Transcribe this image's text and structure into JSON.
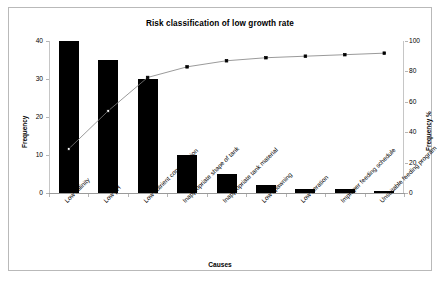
{
  "chart_data": {
    "type": "bar",
    "title": "Risk classification of low growth rate",
    "xlabel": "Causes",
    "ylabel": "Frequency",
    "y2label": "Frequency %",
    "categories": [
      "Low salinity",
      "Low pH",
      "Low nutrient concentration",
      "Inappropriate shape of tank",
      "Inappropriate tank material",
      "Low spawning",
      "Low aeration",
      "Improper feeding schedule",
      "Unsuitable feeding program"
    ],
    "values": [
      40,
      35,
      30,
      10,
      5,
      2,
      1,
      1,
      0.5
    ],
    "cumulative_percent": [
      29,
      54,
      76,
      83,
      87,
      89,
      90,
      91,
      92
    ],
    "ylim": [
      0,
      40
    ],
    "y2lim": [
      0,
      100
    ],
    "yticks": [
      "0",
      "10",
      "20",
      "30",
      "40"
    ],
    "y2ticks": [
      "0",
      "20",
      "40",
      "60",
      "80",
      "100"
    ],
    "grid": false,
    "legend": "none",
    "series": [
      {
        "name": "Frequency",
        "type": "bar",
        "values": [
          40,
          35,
          30,
          10,
          5,
          2,
          1,
          1,
          0.5
        ]
      },
      {
        "name": "Frequency %",
        "type": "line",
        "values": [
          29,
          54,
          76,
          83,
          87,
          89,
          90,
          91,
          92
        ]
      }
    ],
    "colors": {
      "bar": "#000000",
      "line": "#808080",
      "marker": "#000000",
      "frame": "#b9b9b9"
    }
  }
}
